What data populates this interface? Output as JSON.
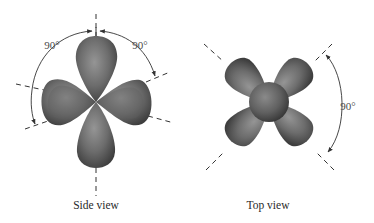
{
  "figure": {
    "panels": [
      {
        "id": "side",
        "caption": "Side view",
        "angle_labels": [
          "90°",
          "90°"
        ],
        "description": "d-orbital shape with four lobes and a torus-like arrangement seen from the side; axes shown as dashed lines"
      },
      {
        "id": "top",
        "caption": "Top view",
        "angle_labels": [
          "90°"
        ],
        "description": "four lobes arranged in an X around a central sphere seen from above; diagonal dashed axes"
      }
    ],
    "colors": {
      "lobe_light": "#8e8e8e",
      "lobe_mid": "#6b6b6b",
      "lobe_dark": "#3f3f3f",
      "line": "#3a3a3a",
      "text": "#2a2a2a",
      "background": "#ffffff"
    }
  }
}
